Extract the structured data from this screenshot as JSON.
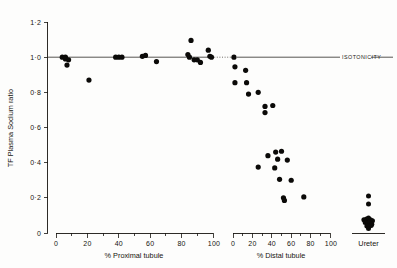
{
  "chart_data": {
    "type": "scatter",
    "title": "",
    "ylabel": "TF Plasma Sodium ratio",
    "ylim": [
      0,
      1.2
    ],
    "y_ticks": [
      0,
      0.2,
      0.4,
      0.6,
      0.8,
      1.0,
      1.2
    ],
    "y_tick_labels": [
      "0",
      "0·2",
      "0·4",
      "0·6",
      "0·8",
      "1·0",
      "1·2"
    ],
    "grid": false,
    "legend": false,
    "annotations": [
      {
        "text": "ISOTONICITY",
        "y": 1.0,
        "note": "horizontal reference line at ratio 1.0"
      }
    ],
    "panels": [
      {
        "name": "proximal",
        "xlabel": "% Proximal tubule",
        "xlim": [
          0,
          100
        ],
        "x_ticks": [
          0,
          20,
          40,
          60,
          80,
          100
        ],
        "x_tick_labels": [
          "0",
          "20",
          "40",
          "60",
          "80",
          "100"
        ],
        "x_minor_ticks": [
          10,
          30,
          50,
          70,
          90
        ],
        "points": [
          {
            "x": 4,
            "y": 1.0
          },
          {
            "x": 6,
            "y": 1.0
          },
          {
            "x": 6,
            "y": 0.99
          },
          {
            "x": 8,
            "y": 0.985
          },
          {
            "x": 7,
            "y": 0.955
          },
          {
            "x": 21,
            "y": 0.87
          },
          {
            "x": 38,
            "y": 1.0
          },
          {
            "x": 40,
            "y": 1.0
          },
          {
            "x": 42,
            "y": 1.0
          },
          {
            "x": 55,
            "y": 1.005
          },
          {
            "x": 57,
            "y": 1.01
          },
          {
            "x": 64,
            "y": 0.975
          },
          {
            "x": 84,
            "y": 1.015
          },
          {
            "x": 85,
            "y": 1.0
          },
          {
            "x": 86,
            "y": 1.095
          },
          {
            "x": 88,
            "y": 0.985
          },
          {
            "x": 90,
            "y": 0.985
          },
          {
            "x": 92,
            "y": 0.97
          },
          {
            "x": 97,
            "y": 1.04
          },
          {
            "x": 98,
            "y": 1.005
          },
          {
            "x": 99,
            "y": 1.0
          }
        ]
      },
      {
        "name": "distal",
        "xlabel": "% Distal tubule",
        "xlim": [
          0,
          100
        ],
        "x_ticks": [
          0,
          20,
          40,
          60,
          80,
          100
        ],
        "x_tick_labels": [
          "0",
          "20",
          "40",
          "60",
          "80",
          "100"
        ],
        "x_minor_ticks": [
          10,
          30,
          50,
          70,
          90
        ],
        "points": [
          {
            "x": 1,
            "y": 1.0
          },
          {
            "x": 2,
            "y": 0.945
          },
          {
            "x": 13,
            "y": 0.925
          },
          {
            "x": 2,
            "y": 0.855
          },
          {
            "x": 14,
            "y": 0.855
          },
          {
            "x": 16,
            "y": 0.79
          },
          {
            "x": 26,
            "y": 0.8
          },
          {
            "x": 33,
            "y": 0.72
          },
          {
            "x": 41,
            "y": 0.725
          },
          {
            "x": 33,
            "y": 0.685
          },
          {
            "x": 44,
            "y": 0.46
          },
          {
            "x": 50,
            "y": 0.465
          },
          {
            "x": 36,
            "y": 0.44
          },
          {
            "x": 46,
            "y": 0.42
          },
          {
            "x": 56,
            "y": 0.415
          },
          {
            "x": 26,
            "y": 0.375
          },
          {
            "x": 43,
            "y": 0.37
          },
          {
            "x": 48,
            "y": 0.305
          },
          {
            "x": 60,
            "y": 0.3
          },
          {
            "x": 52,
            "y": 0.2
          },
          {
            "x": 53,
            "y": 0.185
          },
          {
            "x": 73,
            "y": 0.205
          }
        ]
      },
      {
        "name": "ureter",
        "xlabel": "Ureter",
        "points": [
          {
            "x": 0.5,
            "y": 0.21
          },
          {
            "x": 0.5,
            "y": 0.165
          },
          {
            "x": 0.36,
            "y": 0.075
          },
          {
            "x": 0.44,
            "y": 0.08
          },
          {
            "x": 0.5,
            "y": 0.085
          },
          {
            "x": 0.56,
            "y": 0.075
          },
          {
            "x": 0.62,
            "y": 0.07
          },
          {
            "x": 0.4,
            "y": 0.06
          },
          {
            "x": 0.47,
            "y": 0.055
          },
          {
            "x": 0.54,
            "y": 0.06
          },
          {
            "x": 0.6,
            "y": 0.05
          },
          {
            "x": 0.45,
            "y": 0.04
          },
          {
            "x": 0.52,
            "y": 0.038
          },
          {
            "x": 0.58,
            "y": 0.042
          },
          {
            "x": 0.5,
            "y": 0.025
          }
        ]
      }
    ]
  },
  "axes": {
    "y_title": "TF Plasma Sodium ratio",
    "proximal_title": "% Proximal tubule",
    "distal_title": "% Distal tubule",
    "ureter_title": "Ureter"
  },
  "isotonicity": {
    "label": "ISOTONICITY"
  },
  "y_labels": {
    "t0": "0",
    "t1": "0·2",
    "t2": "0·4",
    "t3": "0·6",
    "t4": "0·8",
    "t5": "1·0",
    "t6": "1·2"
  },
  "x_labels": {
    "p0": "0",
    "p1": "20",
    "p2": "40",
    "p3": "60",
    "p4": "80",
    "p5": "100",
    "d0": "0",
    "d1": "20",
    "d2": "40",
    "d3": "60",
    "d4": "80",
    "d5": "100"
  }
}
